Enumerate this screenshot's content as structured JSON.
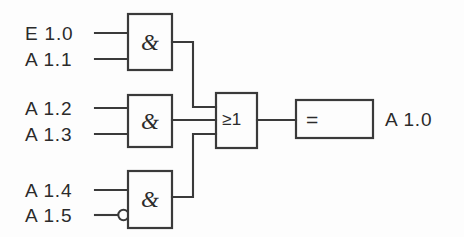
{
  "diagram": {
    "notation": "IEC / DIN 40700 logic symbols",
    "stroke_color": "#3a3a3a",
    "background_color": "#fdfdfd",
    "text_color": "#2b2b2b"
  },
  "inputs": [
    {
      "id": "in-e10",
      "label": "E 1.0",
      "gate": "and-gate-1",
      "pin": 1,
      "inverted": false
    },
    {
      "id": "in-a11",
      "label": "A 1.1",
      "gate": "and-gate-1",
      "pin": 2,
      "inverted": false
    },
    {
      "id": "in-a12",
      "label": "A 1.2",
      "gate": "and-gate-2",
      "pin": 1,
      "inverted": false
    },
    {
      "id": "in-a13",
      "label": "A 1.3",
      "gate": "and-gate-2",
      "pin": 2,
      "inverted": false
    },
    {
      "id": "in-a14",
      "label": "A 1.4",
      "gate": "and-gate-3",
      "pin": 1,
      "inverted": false
    },
    {
      "id": "in-a15",
      "label": "A 1.5",
      "gate": "and-gate-3",
      "pin": 2,
      "inverted": true
    }
  ],
  "gates": [
    {
      "id": "and-gate-1",
      "type": "AND",
      "symbol": "&",
      "inputs": [
        "E 1.0",
        "A 1.1"
      ]
    },
    {
      "id": "and-gate-2",
      "type": "AND",
      "symbol": "&",
      "inputs": [
        "A 1.2",
        "A 1.3"
      ]
    },
    {
      "id": "and-gate-3",
      "type": "AND",
      "symbol": "&",
      "inputs": [
        "A 1.4",
        "A 1.5"
      ]
    },
    {
      "id": "or-gate",
      "type": "OR",
      "symbol": "≥1",
      "inputs": [
        "and-gate-1",
        "and-gate-2",
        "and-gate-3"
      ]
    },
    {
      "id": "output-gate",
      "type": "BUFFER",
      "symbol": "=",
      "inputs": [
        "or-gate"
      ]
    }
  ],
  "outputs": [
    {
      "id": "out-a10",
      "label": "A 1.0",
      "source": "output-gate"
    }
  ]
}
